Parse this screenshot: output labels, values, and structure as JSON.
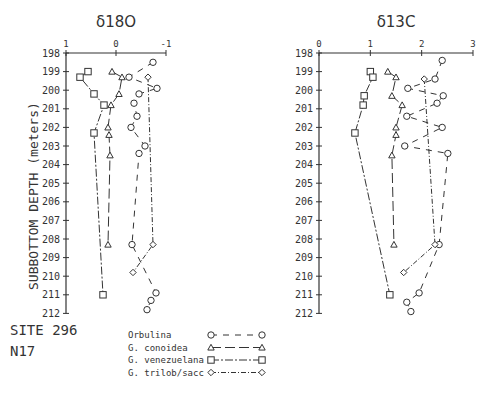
{
  "site_label": "SITE 296",
  "zone_label": "N17",
  "ylabel": "SUBBOTTOM DEPTH (meters)",
  "legend": [
    {
      "name": "Orbulina",
      "marker": "circle",
      "dash": "6,6"
    },
    {
      "name": "G. conoidea",
      "marker": "triangle",
      "dash": "10,4"
    },
    {
      "name": "G. venezuelana",
      "marker": "square",
      "dash": "8,2,2,2"
    },
    {
      "name": "G. trilob/sacc",
      "marker": "diamond",
      "dash": "5,2,1,2"
    }
  ],
  "chart_data": [
    {
      "type": "line",
      "title": "δ18O",
      "xlabel": "δ18O",
      "ylabel": "SUBBOTTOM DEPTH (meters)",
      "xlim": [
        1,
        -1
      ],
      "ylim": [
        212,
        198
      ],
      "xticks": [
        "1",
        "0",
        "-1"
      ],
      "yticks": [
        198,
        199,
        200,
        201,
        202,
        203,
        204,
        205,
        206,
        207,
        208,
        209,
        210,
        211,
        212
      ],
      "series": [
        {
          "name": "Orbulina",
          "points": [
            [
              -0.74,
              198.5
            ],
            [
              -0.26,
              199.3
            ],
            [
              -0.82,
              199.9
            ],
            [
              -0.46,
              200.2
            ],
            [
              -0.36,
              200.7
            ],
            [
              -0.42,
              201.4
            ],
            [
              -0.3,
              202.0
            ],
            [
              -0.58,
              203.0
            ],
            [
              -0.46,
              203.4
            ],
            [
              -0.32,
              208.3
            ],
            [
              -0.8,
              210.9
            ],
            [
              -0.7,
              211.3
            ],
            [
              -0.62,
              211.8
            ]
          ]
        },
        {
          "name": "G. conoidea",
          "points": [
            [
              0.08,
              199.0
            ],
            [
              -0.12,
              199.3
            ],
            [
              -0.06,
              200.2
            ],
            [
              0.1,
              200.8
            ],
            [
              0.16,
              202.0
            ],
            [
              0.14,
              202.4
            ],
            [
              0.12,
              203.5
            ],
            [
              0.16,
              208.3
            ]
          ]
        },
        {
          "name": "G. venezuelana",
          "points": [
            [
              0.56,
              199.0
            ],
            [
              0.72,
              199.3
            ],
            [
              0.44,
              200.2
            ],
            [
              0.24,
              200.8
            ],
            [
              0.44,
              202.3
            ],
            [
              0.26,
              211.0
            ]
          ]
        },
        {
          "name": "G. trilob/sacc",
          "points": [
            [
              -0.64,
              199.3
            ],
            [
              -0.74,
              208.3
            ],
            [
              -0.34,
              209.8
            ]
          ]
        }
      ]
    },
    {
      "type": "line",
      "title": "δ13C",
      "xlabel": "δ13C",
      "ylabel": "SUBBOTTOM DEPTH (meters)",
      "xlim": [
        0,
        3
      ],
      "ylim": [
        212,
        198
      ],
      "xticks": [
        "0",
        "1",
        "2",
        "3"
      ],
      "yticks": [
        198,
        199,
        200,
        201,
        202,
        203,
        204,
        205,
        206,
        207,
        208,
        209,
        210,
        211,
        212
      ],
      "series": [
        {
          "name": "Orbulina",
          "points": [
            [
              2.4,
              198.4
            ],
            [
              2.26,
              199.4
            ],
            [
              1.73,
              199.9
            ],
            [
              2.42,
              200.3
            ],
            [
              2.3,
              200.7
            ],
            [
              1.71,
              201.4
            ],
            [
              2.4,
              202.0
            ],
            [
              1.67,
              203.0
            ],
            [
              2.51,
              203.4
            ],
            [
              2.34,
              208.3
            ],
            [
              1.95,
              210.9
            ],
            [
              1.71,
              211.4
            ],
            [
              1.79,
              211.9
            ]
          ]
        },
        {
          "name": "G. conoidea",
          "points": [
            [
              1.34,
              199.0
            ],
            [
              1.5,
              199.3
            ],
            [
              1.42,
              200.3
            ],
            [
              1.62,
              200.8
            ],
            [
              1.5,
              202.0
            ],
            [
              1.5,
              202.4
            ],
            [
              1.42,
              203.5
            ],
            [
              1.46,
              208.3
            ]
          ]
        },
        {
          "name": "G. venezuelana",
          "points": [
            [
              1.0,
              199.0
            ],
            [
              1.05,
              199.3
            ],
            [
              0.88,
              200.3
            ],
            [
              0.86,
              200.8
            ],
            [
              0.7,
              202.3
            ],
            [
              1.38,
              211.0
            ]
          ]
        },
        {
          "name": "G. trilob/sacc",
          "points": [
            [
              2.05,
              199.4
            ],
            [
              2.26,
              208.3
            ],
            [
              1.65,
              209.8
            ]
          ]
        }
      ]
    }
  ]
}
